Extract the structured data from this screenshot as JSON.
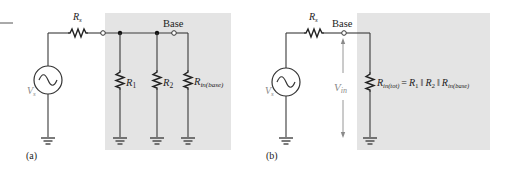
{
  "figure": {
    "panel_a": {
      "caption": "(a)",
      "source_resistor": {
        "symbol": "R",
        "sub": "s"
      },
      "source_voltage": {
        "symbol": "V",
        "sub": "s"
      },
      "node_label": "Base",
      "resistors": [
        {
          "symbol": "R",
          "sub": "1"
        },
        {
          "symbol": "R",
          "sub": "2"
        },
        {
          "symbol": "R",
          "sub": "in(base)"
        }
      ]
    },
    "panel_b": {
      "caption": "(b)",
      "source_resistor": {
        "symbol": "R",
        "sub": "s"
      },
      "source_voltage": {
        "symbol": "V",
        "sub": "s"
      },
      "node_label": "Base",
      "input_voltage": {
        "symbol": "V",
        "sub": "in"
      },
      "equivalent": {
        "lhs_symbol": "R",
        "lhs_sub": "in(tot)",
        "equals": "=",
        "terms": [
          {
            "symbol": "R",
            "sub": "1"
          },
          {
            "symbol": "R",
            "sub": "2"
          },
          {
            "symbol": "R",
            "sub": "in(base)"
          }
        ],
        "parallel_operator": "‖"
      }
    },
    "colors": {
      "shading": "#e4e4e4",
      "wire": "#3a3a3a",
      "muted_label": "#8a8a8a"
    }
  }
}
